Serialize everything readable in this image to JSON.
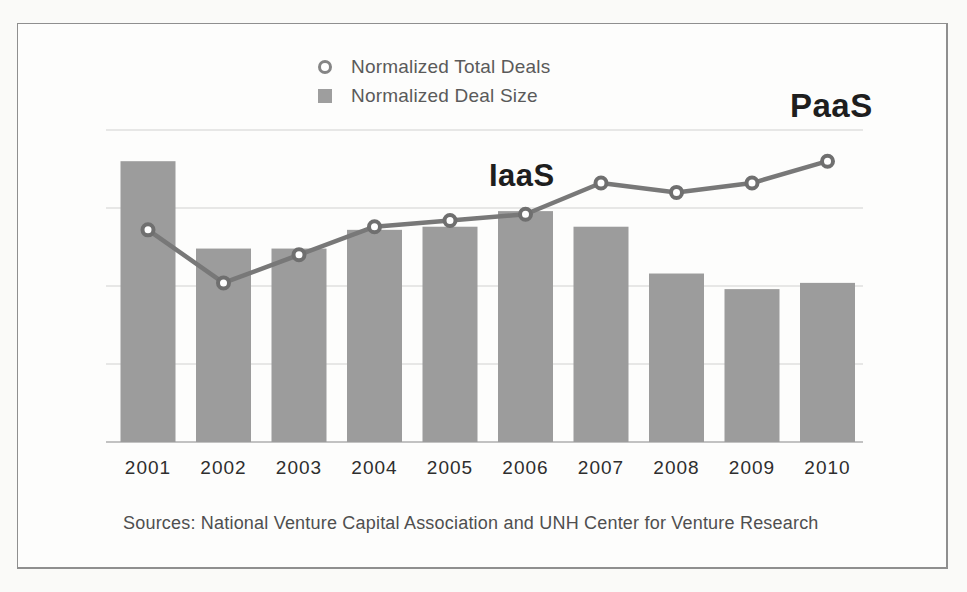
{
  "legend": {
    "items": [
      {
        "label": "Normalized Total Deals",
        "marker": "open-circle-icon"
      },
      {
        "label": "Normalized Deal Size",
        "marker": "filled-square-icon"
      }
    ]
  },
  "footer": {
    "source_note": "Sources: National Venture Capital Association and UNH Center for Venture Research"
  },
  "colors": {
    "bar": "#9c9c9c",
    "line": "#787878",
    "marker_ring": "#6f6f6f",
    "marker_fill": "#ffffff",
    "gridline": "#dcdcdc",
    "axis_line": "#c2c2c2",
    "annotation_text": "#1e1e1e",
    "year_label_text": "#2e2e2e",
    "legend_text": "#5a5a5a",
    "source_text": "#4f4f4f",
    "frame_border": "#8f8f8f"
  },
  "chart_data": {
    "type": "combo",
    "title": "",
    "xlabel": "",
    "ylabel": "",
    "categories": [
      "2001",
      "2002",
      "2003",
      "2004",
      "2005",
      "2006",
      "2007",
      "2008",
      "2009",
      "2010"
    ],
    "series": [
      {
        "name": "Normalized Total Deals",
        "type": "line",
        "marker": "open-circle",
        "values": [
          0.68,
          0.51,
          0.6,
          0.69,
          0.71,
          0.73,
          0.83,
          0.8,
          0.83,
          0.9
        ]
      },
      {
        "name": "Normalized Deal Size",
        "type": "bar",
        "values": [
          0.9,
          0.62,
          0.62,
          0.68,
          0.69,
          0.74,
          0.69,
          0.54,
          0.49,
          0.51
        ]
      }
    ],
    "ylim": [
      0,
      1.0
    ],
    "y_gridline_step": 0.25,
    "grid": "horizontal-only",
    "y_tick_labels": "none",
    "legend_position": "top-center",
    "annotations": [
      {
        "text": "IaaS",
        "anchor_category": "2006",
        "placement": "above-line"
      },
      {
        "text": "PaaS",
        "anchor_category": "2010",
        "placement": "above-line"
      }
    ]
  }
}
